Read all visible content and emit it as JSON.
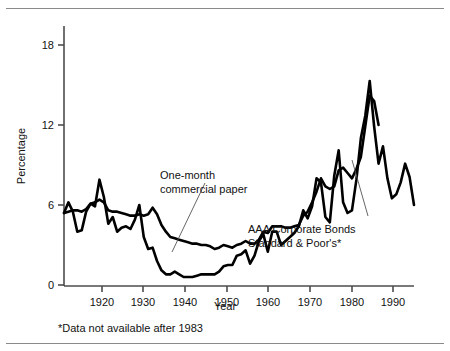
{
  "figure": {
    "name": "interest-rates-line-chart",
    "background": "#ffffff",
    "line_color": "#000000",
    "axis_color": "#4d4d4d",
    "rule_color": "#8a8a8a"
  },
  "axes": {
    "y_title": "Percentage",
    "x_title": "Year",
    "y_ticks": [
      "0",
      "6",
      "12",
      "18"
    ],
    "x_ticks": [
      "1920",
      "1930",
      "1940",
      "1950",
      "1960",
      "1970",
      "1980",
      "1990"
    ]
  },
  "annotations": {
    "commercial_paper": "One-month\ncommercial paper",
    "commercial_paper_line1": "One-month",
    "commercial_paper_line2": "commercial paper",
    "aaa_line1": "AAA Corporate Bonds",
    "aaa_line2": "Standard & Poor's*"
  },
  "footnote": "*Data not available after 1983",
  "chart_data": {
    "type": "line",
    "title": "",
    "xlabel": "Year",
    "ylabel": "Percentage",
    "xlim": [
      1912,
      1991
    ],
    "ylim": [
      0,
      20
    ],
    "y_ticks": [
      0,
      6,
      12,
      18
    ],
    "x_ticks": [
      1920,
      1930,
      1940,
      1950,
      1960,
      1970,
      1980,
      1990
    ],
    "grid": false,
    "legend": "inline-annotations",
    "series": [
      {
        "name": "One-month commercial paper",
        "label_text": "One-month commercial paper",
        "color": "#000000",
        "x": [
          1912,
          1913,
          1914,
          1915,
          1916,
          1917,
          1918,
          1919,
          1920,
          1921,
          1922,
          1923,
          1924,
          1925,
          1926,
          1927,
          1928,
          1929,
          1930,
          1931,
          1932,
          1933,
          1934,
          1935,
          1936,
          1937,
          1938,
          1939,
          1940,
          1941,
          1942,
          1943,
          1944,
          1945,
          1946,
          1947,
          1948,
          1949,
          1950,
          1951,
          1952,
          1953,
          1954,
          1955,
          1956,
          1957,
          1958,
          1959,
          1960,
          1961,
          1962,
          1963,
          1964,
          1965,
          1966,
          1967,
          1968,
          1969,
          1970,
          1971,
          1972,
          1973,
          1974,
          1975,
          1976,
          1977,
          1978,
          1979,
          1980,
          1981,
          1982,
          1983,
          1984,
          1985,
          1986,
          1987,
          1988,
          1989,
          1990,
          1991
        ],
        "values": [
          5.4,
          6.2,
          5.5,
          4.0,
          4.1,
          5.5,
          6.1,
          5.9,
          7.9,
          6.6,
          4.6,
          5.1,
          4.0,
          4.3,
          4.4,
          4.2,
          4.9,
          6.0,
          3.6,
          2.7,
          2.8,
          1.8,
          1.1,
          0.8,
          0.8,
          1.0,
          0.8,
          0.6,
          0.6,
          0.6,
          0.7,
          0.8,
          0.8,
          0.8,
          0.8,
          1.0,
          1.4,
          1.5,
          1.5,
          2.2,
          2.3,
          2.6,
          1.6,
          2.2,
          3.3,
          3.8,
          2.5,
          4.0,
          4.0,
          3.0,
          3.3,
          3.6,
          3.9,
          4.4,
          5.6,
          5.0,
          5.9,
          8.0,
          7.7,
          5.1,
          4.7,
          8.2,
          10.1,
          6.2,
          5.4,
          5.6,
          7.9,
          11.0,
          12.7,
          15.3,
          11.9,
          9.1,
          10.4,
          8.0,
          6.5,
          6.8,
          7.7,
          9.1,
          8.1,
          6.0
        ]
      },
      {
        "name": "AAA Corporate Bonds Standard & Poor's",
        "label_text": "AAA Corporate Bonds Standard & Poor's*",
        "color": "#000000",
        "x": [
          1912,
          1913,
          1914,
          1915,
          1916,
          1917,
          1918,
          1919,
          1920,
          1921,
          1922,
          1923,
          1924,
          1925,
          1926,
          1927,
          1928,
          1929,
          1930,
          1931,
          1932,
          1933,
          1934,
          1935,
          1936,
          1937,
          1938,
          1939,
          1940,
          1941,
          1942,
          1943,
          1944,
          1945,
          1946,
          1947,
          1948,
          1949,
          1950,
          1951,
          1952,
          1953,
          1954,
          1955,
          1956,
          1957,
          1958,
          1959,
          1960,
          1961,
          1962,
          1963,
          1964,
          1965,
          1966,
          1967,
          1968,
          1969,
          1970,
          1971,
          1972,
          1973,
          1974,
          1975,
          1976,
          1977,
          1978,
          1979,
          1980,
          1981,
          1982,
          1983
        ],
        "values": [
          5.4,
          5.5,
          5.6,
          5.6,
          5.5,
          5.7,
          6.1,
          6.2,
          6.4,
          6.2,
          5.6,
          5.5,
          5.5,
          5.4,
          5.3,
          5.2,
          5.2,
          5.3,
          5.2,
          5.3,
          5.8,
          5.3,
          4.5,
          4.0,
          3.6,
          3.5,
          3.4,
          3.3,
          3.2,
          3.1,
          3.1,
          3.0,
          3.0,
          2.9,
          2.7,
          2.8,
          3.0,
          2.9,
          2.8,
          3.0,
          3.1,
          3.3,
          3.1,
          3.1,
          3.4,
          4.0,
          3.9,
          4.4,
          4.4,
          4.4,
          4.3,
          4.3,
          4.4,
          4.5,
          5.2,
          5.5,
          6.2,
          7.0,
          8.0,
          7.4,
          7.2,
          7.4,
          8.6,
          8.8,
          8.4,
          8.0,
          8.7,
          9.6,
          11.9,
          14.2,
          13.8,
          12.0
        ]
      }
    ],
    "notes": [
      "*Data not available after 1983"
    ]
  }
}
